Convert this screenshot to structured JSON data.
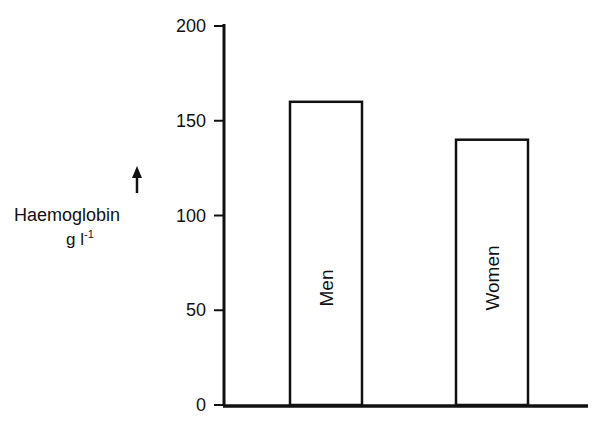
{
  "chart_data": {
    "type": "bar",
    "title": "",
    "categories": [
      "Men",
      "Women"
    ],
    "values": [
      160,
      140
    ],
    "xlabel": "",
    "ylabel": "Haemoglobin",
    "ylabel_unit": "g l",
    "ylabel_unit_exp": "-1",
    "ylim": [
      0,
      200
    ],
    "yticks": [
      0,
      50,
      100,
      150,
      200
    ],
    "grid": false,
    "legend": "none",
    "bar_labels_rotated": true
  }
}
